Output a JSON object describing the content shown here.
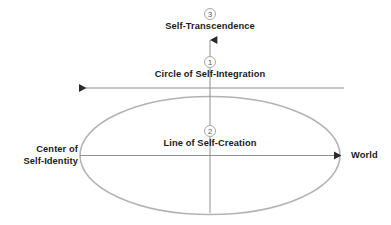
{
  "diagram": {
    "type": "conceptual-axes-diagram",
    "background_color": "#ffffff",
    "ellipse_color": "#b3b3b3",
    "axis_color": "#8f8f8f",
    "text_color": "#1a1a1a",
    "marker_color": "#a8a8a8",
    "labels": {
      "top": "Self-Transcendence",
      "upper_axis": "Circle of Self-Integration",
      "horizontal_axis": "Line of Self-Creation",
      "left_line1": "Center of",
      "left_line2": "Self-Identity",
      "right": "World"
    },
    "markers": [
      {
        "number": "1",
        "relates_to": "Circle of Self-Integration"
      },
      {
        "number": "2",
        "relates_to": "Line of Self-Creation"
      },
      {
        "number": "3",
        "relates_to": "Self-Transcendence"
      }
    ]
  }
}
